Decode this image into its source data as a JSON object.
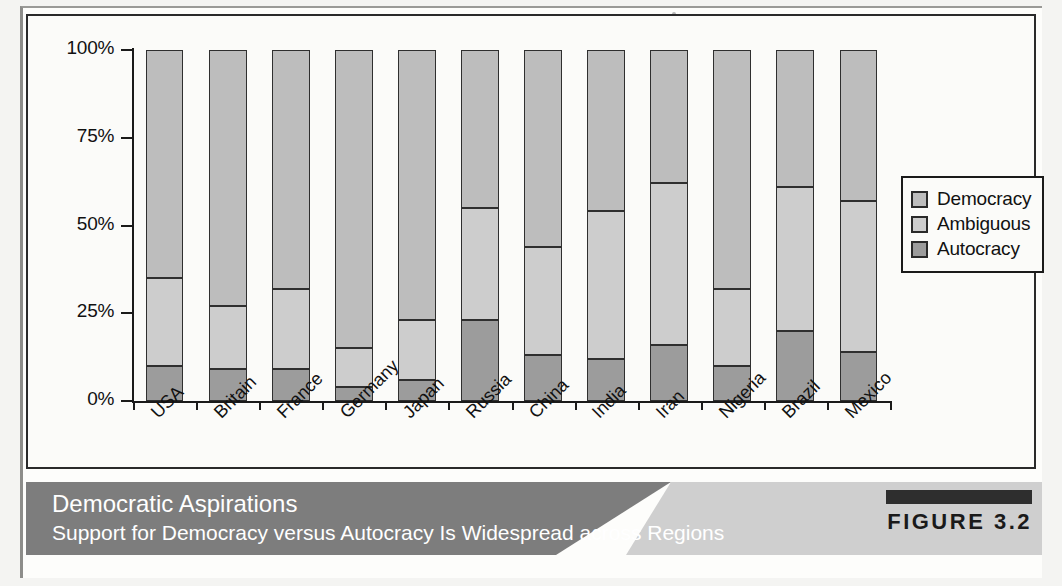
{
  "figure": {
    "tag_label": "FIGURE 3.2",
    "caption_title": "Democratic Aspirations",
    "caption_subtitle": "Support for Democracy versus Autocracy Is Widespread across Regions"
  },
  "legend": {
    "items": [
      {
        "label": "Democracy",
        "color": "#bdbdbd"
      },
      {
        "label": "Ambiguous",
        "color": "#cdcdcd"
      },
      {
        "label": "Autocracy",
        "color": "#9c9c9c"
      }
    ]
  },
  "axis": {
    "y_ticks": [
      "100%",
      "75%",
      "50%",
      "25%",
      "0%"
    ]
  },
  "chart_data": {
    "type": "bar",
    "stacked": true,
    "title": "Democratic Aspirations",
    "subtitle": "Support for Democracy versus Autocracy Is Widespread across Regions",
    "xlabel": "",
    "ylabel": "",
    "ylim": [
      0,
      100
    ],
    "y_tick_values": [
      0,
      25,
      50,
      75,
      100
    ],
    "y_tick_labels": [
      "0%",
      "25%",
      "50%",
      "75%",
      "100%"
    ],
    "grid": false,
    "legend_position": "right",
    "categories": [
      "USA",
      "Britain",
      "France",
      "Germany",
      "Japan",
      "Russia",
      "China",
      "India",
      "Iran",
      "Nigeria",
      "Brazil",
      "Mexico"
    ],
    "series": [
      {
        "name": "Autocracy",
        "color": "#9c9c9c",
        "values": [
          10,
          9,
          9,
          4,
          6,
          23,
          13,
          12,
          16,
          10,
          20,
          14
        ]
      },
      {
        "name": "Ambiguous",
        "color": "#cdcdcd",
        "values": [
          25,
          18,
          23,
          11,
          17,
          32,
          31,
          42,
          46,
          22,
          41,
          43
        ]
      },
      {
        "name": "Democracy",
        "color": "#bdbdbd",
        "values": [
          65,
          73,
          68,
          85,
          77,
          45,
          56,
          46,
          38,
          68,
          39,
          43
        ]
      }
    ],
    "cumulative_tops": {
      "autocracy": [
        10,
        9,
        9,
        4,
        6,
        23,
        13,
        12,
        16,
        10,
        20,
        14
      ],
      "ambiguous": [
        35,
        27,
        32,
        15,
        23,
        55,
        44,
        54,
        62,
        32,
        61,
        57
      ],
      "democracy": [
        100,
        100,
        100,
        100,
        100,
        100,
        100,
        100,
        100,
        100,
        100,
        100
      ]
    }
  }
}
